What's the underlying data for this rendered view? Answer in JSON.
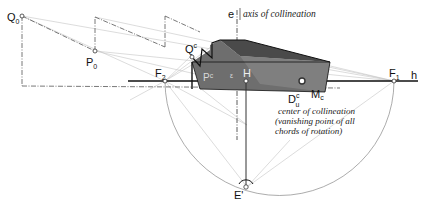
{
  "diagram": {
    "type": "perspective-collineation",
    "labels": {
      "Q0": {
        "main": "Q",
        "sub": "0"
      },
      "P0": {
        "main": "P",
        "sub": "0"
      },
      "Qc": {
        "main": "Q",
        "sup": "c"
      },
      "Pc": {
        "main": "P",
        "sup": "c"
      },
      "F2": {
        "main": "F",
        "sub": "2"
      },
      "F1": {
        "main": "F",
        "sub": "1"
      },
      "H": "H",
      "h": "h",
      "e": "e",
      "Duc": {
        "main": "D",
        "sup": "c",
        "sub": "u"
      },
      "Mc": {
        "main": "M",
        "sub": "c"
      },
      "E_prime": "E'",
      "epsilon": "ε"
    },
    "annotations": {
      "axis": "axis of collineation",
      "center_line1": "center of collineation",
      "center_line2": "(vanishing point of  all",
      "center_line3": "chords of rotation)"
    },
    "colors": {
      "solid_dark": "#4a4a4a",
      "solid_mid": "#6e6e6e",
      "solid_light": "#8a8a8a",
      "construction": "#bdbdbd",
      "line": "#222222"
    }
  }
}
